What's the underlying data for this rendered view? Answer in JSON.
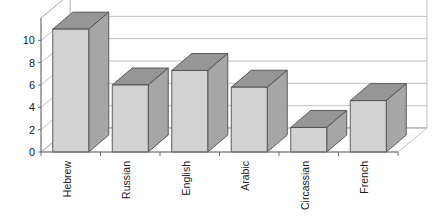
{
  "chart_data": {
    "type": "bar",
    "title": "",
    "subtitle": "",
    "xlabel": "",
    "ylabel": "",
    "categories": [
      "Hebrew",
      "Russian",
      "English",
      "Arabic",
      "Circassian",
      "French"
    ],
    "values": [
      11,
      6,
      7.3,
      5.8,
      2.2,
      4.6
    ],
    "series": [
      {
        "name": "Languages",
        "values": [
          11,
          6,
          7.3,
          5.8,
          2.2,
          4.6
        ]
      }
    ],
    "ylim": [
      0,
      12
    ],
    "yticks": [
      0,
      2,
      4,
      6,
      8,
      10
    ],
    "ytick_labels": [
      "0",
      "2",
      "4",
      "6",
      "8",
      "10"
    ],
    "grid": true,
    "grid_axis": "y",
    "legend": false,
    "legend_position": "none",
    "rendering": "3d-perspective",
    "xtick_label_rotation": -90,
    "annotations": []
  },
  "style": {
    "bar_front_color": "#d2d2d2",
    "bar_side_color": "#a6a6a6",
    "bar_top_color": "#969696",
    "bar_edge_color": "#4d4d4d",
    "gridline_color": "#b0b0b0",
    "axis_color": "#6e6e6e",
    "wall_color": "#ffffff",
    "floor_color": "#ffffff",
    "text_color": "#1a1a1a",
    "background": "#ffffff"
  },
  "geometry": {
    "plot_left": 41,
    "plot_right": 398,
    "baseline_y": 152,
    "top_y": 18,
    "depth_dx": 29,
    "depth_dy": -24,
    "bar_width": 36,
    "bar_depth_dx": 20,
    "bar_depth_dy": -17,
    "value_per_px": 0.0896
  }
}
